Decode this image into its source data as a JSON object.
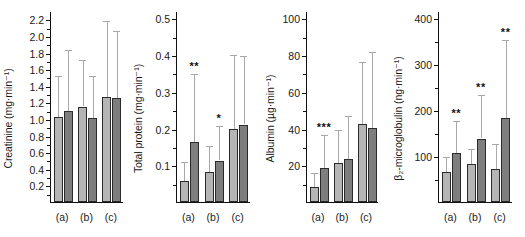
{
  "figure": {
    "background": "#ffffff",
    "series_colors": {
      "light": "#b5b5b5",
      "dark": "#7e7e7e",
      "error": "#a8a8a8",
      "axis": "#111111"
    },
    "group_labels": [
      "(a)",
      "(b)",
      "(c)"
    ]
  },
  "chart_data": [
    {
      "type": "bar",
      "title": "",
      "ylabel": "Creatinine (mg·min⁻¹)",
      "xlabel": "",
      "categories": [
        "(a)",
        "(b)",
        "(c)"
      ],
      "ylim": [
        0,
        2.3
      ],
      "yticks": [
        0.2,
        0.4,
        0.6,
        0.8,
        1.0,
        1.2,
        1.4,
        1.6,
        1.8,
        2.0,
        2.2
      ],
      "ytick_labels": [
        "0.2",
        "0.4",
        "0.6",
        "0.8",
        "1.0",
        "1.2",
        "1.4",
        "1.6",
        "1.8",
        "2.0",
        "2.2"
      ],
      "grid": false,
      "legend": "none",
      "series": [
        {
          "name": "light",
          "values": [
            1.02,
            1.15,
            1.27
          ],
          "errors_upper": [
            1.52,
            1.71,
            2.18
          ]
        },
        {
          "name": "dark",
          "values": [
            1.1,
            1.01,
            1.25
          ],
          "errors_upper": [
            1.83,
            1.52,
            2.06
          ]
        }
      ],
      "significance": [
        "",
        "",
        ""
      ]
    },
    {
      "type": "bar",
      "title": "",
      "ylabel": "Total protein (mg·min⁻¹)",
      "xlabel": "",
      "categories": [
        "(a)",
        "(b)",
        "(c)"
      ],
      "ylim": [
        0,
        0.52
      ],
      "yticks": [
        0.1,
        0.2,
        0.3,
        0.4,
        0.5
      ],
      "ytick_labels": [
        "0.1",
        "0.2",
        "0.3",
        "0.4",
        "0.5"
      ],
      "grid": false,
      "legend": "none",
      "series": [
        {
          "name": "light",
          "values": [
            0.056,
            0.081,
            0.198
          ],
          "errors_upper": [
            0.108,
            0.152,
            0.4
          ]
        },
        {
          "name": "dark",
          "values": [
            0.163,
            0.113,
            0.211
          ],
          "errors_upper": [
            0.348,
            0.206,
            0.397
          ]
        }
      ],
      "significance": [
        "**",
        "*",
        ""
      ]
    },
    {
      "type": "bar",
      "title": "",
      "ylabel": "Albumin (µg·min⁻¹)",
      "xlabel": "",
      "categories": [
        "(a)",
        "(b)",
        "(c)"
      ],
      "ylim": [
        0,
        104
      ],
      "yticks": [
        20,
        40,
        60,
        80,
        100
      ],
      "ytick_labels": [
        "20",
        "40",
        "60",
        "80",
        "100"
      ],
      "grid": false,
      "legend": "none",
      "series": [
        {
          "name": "light",
          "values": [
            8,
            21.5,
            42.5
          ],
          "errors_upper": [
            16,
            39,
            76.5
          ]
        },
        {
          "name": "dark",
          "values": [
            18.5,
            23.5,
            40.5
          ],
          "errors_upper": [
            36.5,
            47,
            81.5
          ]
        }
      ],
      "significance": [
        "***",
        "",
        ""
      ]
    },
    {
      "type": "bar",
      "title": "",
      "ylabel": "β₂-microglobulin (ng·min⁻¹)",
      "xlabel": "",
      "categories": [
        "(a)",
        "(b)",
        "(c)"
      ],
      "ylim": [
        0,
        415
      ],
      "yticks": [
        100,
        200,
        300,
        400
      ],
      "ytick_labels": [
        "100",
        "200",
        "300",
        "400"
      ],
      "grid": false,
      "legend": "none",
      "series": [
        {
          "name": "light",
          "values": [
            65,
            83,
            72
          ],
          "errors_upper": [
            98,
            115,
            125
          ]
        },
        {
          "name": "dark",
          "values": [
            107,
            138,
            183
          ],
          "errors_upper": [
            175,
            233,
            352
          ]
        }
      ],
      "significance": [
        "**",
        "**",
        "**"
      ]
    }
  ]
}
